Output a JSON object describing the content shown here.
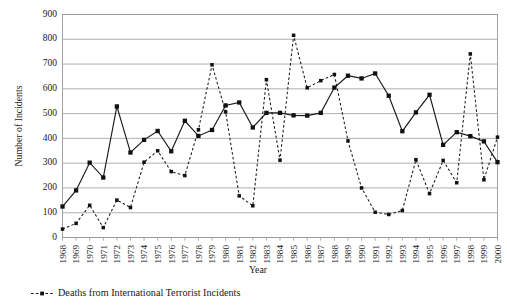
{
  "chart_data": {
    "type": "line",
    "title": "",
    "xlabel": "Year",
    "ylabel": "Number of Incidents",
    "ylim": [
      0,
      900
    ],
    "ytick_step": 100,
    "grid": true,
    "legend_position": "below-left",
    "categories": [
      "1968",
      "1969",
      "1970",
      "1971",
      "1972",
      "1973",
      "1974",
      "1975",
      "1976",
      "1977",
      "1978",
      "1979",
      "1980",
      "1981",
      "1982",
      "1983",
      "1984",
      "1985",
      "1986",
      "1987",
      "1988",
      "1989",
      "1990",
      "1991",
      "1992",
      "1993",
      "1994",
      "1995",
      "1996",
      "1997",
      "1998",
      "1999",
      "2000"
    ],
    "yticks": [
      0,
      100,
      200,
      300,
      400,
      500,
      600,
      700,
      800,
      900
    ],
    "series": [
      {
        "name": "International Terrorist Incidents",
        "style": "solid",
        "marker": "square",
        "color": "#1a1a1a",
        "in_legend": false,
        "values": [
          125,
          190,
          302,
          242,
          529,
          343,
          394,
          430,
          348,
          471,
          410,
          434,
          533,
          545,
          444,
          503,
          503,
          493,
          492,
          503,
          605,
          653,
          642,
          662,
          572,
          429,
          505,
          576,
          374,
          425,
          409,
          388,
          304
        ]
      },
      {
        "name": "Deaths from International Terrorist Incidents",
        "style": "dashed",
        "marker": "square",
        "color": "#1a1a1a",
        "in_legend": true,
        "values": [
          34,
          57,
          130,
          40,
          151,
          121,
          304,
          350,
          266,
          250,
          435,
          697,
          507,
          168,
          128,
          637,
          312,
          816,
          604,
          633,
          658,
          390,
          200,
          102,
          93,
          109,
          314,
          177,
          311,
          221,
          741,
          233,
          405
        ]
      }
    ]
  },
  "legend": {
    "entries": [
      {
        "label": "Deaths from International Terrorist Incidents",
        "style": "dashed",
        "marker": "square"
      }
    ]
  }
}
